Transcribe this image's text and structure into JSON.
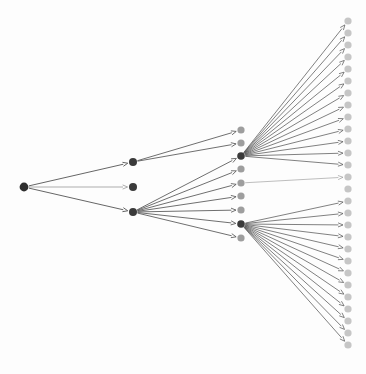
{
  "diagram": {
    "type": "directed-tree",
    "canvas": {
      "width": 366,
      "height": 374,
      "background": "#fdfdfd"
    },
    "colors": {
      "node_dark": "#3a3a3a",
      "node_mid": "#7a7a7a",
      "node_light": "#c8c8c8",
      "edge_dark": "#4a4a4a",
      "edge_light": "#9a9a9a",
      "background": "#fdfdfd"
    },
    "levels": [
      {
        "name": "level-0-root",
        "x": 24,
        "node_radius": 4.2,
        "nodes": [
          {
            "id": "r0",
            "y": 187,
            "color": "#2e2e2e",
            "radius": 4.4
          }
        ]
      },
      {
        "name": "level-1",
        "x": 133,
        "node_radius": 4.0,
        "nodes": [
          {
            "id": "a0",
            "y": 162,
            "color": "#3a3a3a",
            "radius": 4.0
          },
          {
            "id": "a1",
            "y": 187,
            "color": "#3a3a3a",
            "radius": 4.0
          },
          {
            "id": "a2",
            "y": 212,
            "color": "#3a3a3a",
            "radius": 4.0
          }
        ]
      },
      {
        "name": "level-2",
        "x": 241,
        "node_radius": 3.6,
        "nodes": [
          {
            "id": "b0",
            "y": 130,
            "color": "#9e9e9e",
            "radius": 3.6
          },
          {
            "id": "b1",
            "y": 143,
            "color": "#9e9e9e",
            "radius": 3.6
          },
          {
            "id": "b2",
            "y": 156,
            "color": "#3a3a3a",
            "radius": 3.8
          },
          {
            "id": "b3",
            "y": 169,
            "color": "#9e9e9e",
            "radius": 3.6
          },
          {
            "id": "b4",
            "y": 183,
            "color": "#9e9e9e",
            "radius": 3.6
          },
          {
            "id": "b5",
            "y": 196,
            "color": "#9e9e9e",
            "radius": 3.6
          },
          {
            "id": "b6",
            "y": 210,
            "color": "#9e9e9e",
            "radius": 3.6
          },
          {
            "id": "b7",
            "y": 224,
            "color": "#3a3a3a",
            "radius": 3.8
          },
          {
            "id": "b8",
            "y": 238,
            "color": "#9e9e9e",
            "radius": 3.6
          }
        ]
      },
      {
        "name": "level-3-leaves",
        "x": 348,
        "node_radius": 3.6,
        "nodes": [
          {
            "id": "c0",
            "y": 21,
            "color": "#c6c6c6",
            "radius": 3.6
          },
          {
            "id": "c1",
            "y": 33,
            "color": "#c6c6c6",
            "radius": 3.6
          },
          {
            "id": "c2",
            "y": 45,
            "color": "#c6c6c6",
            "radius": 3.6
          },
          {
            "id": "c3",
            "y": 57,
            "color": "#c6c6c6",
            "radius": 3.6
          },
          {
            "id": "c4",
            "y": 69,
            "color": "#c6c6c6",
            "radius": 3.6
          },
          {
            "id": "c5",
            "y": 81,
            "color": "#c6c6c6",
            "radius": 3.6
          },
          {
            "id": "c6",
            "y": 93,
            "color": "#c6c6c6",
            "radius": 3.6
          },
          {
            "id": "c7",
            "y": 105,
            "color": "#c6c6c6",
            "radius": 3.6
          },
          {
            "id": "c8",
            "y": 117,
            "color": "#c6c6c6",
            "radius": 3.6
          },
          {
            "id": "c9",
            "y": 129,
            "color": "#c6c6c6",
            "radius": 3.6
          },
          {
            "id": "c10",
            "y": 141,
            "color": "#c6c6c6",
            "radius": 3.6
          },
          {
            "id": "c11",
            "y": 153,
            "color": "#c6c6c6",
            "radius": 3.6
          },
          {
            "id": "c12",
            "y": 165,
            "color": "#c6c6c6",
            "radius": 3.6
          },
          {
            "id": "c13",
            "y": 177,
            "color": "#c6c6c6",
            "radius": 3.6
          },
          {
            "id": "c14",
            "y": 189,
            "color": "#c6c6c6",
            "radius": 3.6
          },
          {
            "id": "c15",
            "y": 201,
            "color": "#c6c6c6",
            "radius": 3.6
          },
          {
            "id": "c16",
            "y": 213,
            "color": "#c6c6c6",
            "radius": 3.6
          },
          {
            "id": "c17",
            "y": 225,
            "color": "#c6c6c6",
            "radius": 3.6
          },
          {
            "id": "c18",
            "y": 237,
            "color": "#c6c6c6",
            "radius": 3.6
          },
          {
            "id": "c19",
            "y": 249,
            "color": "#c6c6c6",
            "radius": 3.6
          },
          {
            "id": "c20",
            "y": 261,
            "color": "#c6c6c6",
            "radius": 3.6
          },
          {
            "id": "c21",
            "y": 273,
            "color": "#c6c6c6",
            "radius": 3.6
          },
          {
            "id": "c22",
            "y": 285,
            "color": "#c6c6c6",
            "radius": 3.6
          },
          {
            "id": "c23",
            "y": 297,
            "color": "#c6c6c6",
            "radius": 3.6
          },
          {
            "id": "c24",
            "y": 309,
            "color": "#c6c6c6",
            "radius": 3.6
          },
          {
            "id": "c25",
            "y": 321,
            "color": "#c6c6c6",
            "radius": 3.6
          },
          {
            "id": "c26",
            "y": 333,
            "color": "#c6c6c6",
            "radius": 3.6
          },
          {
            "id": "c27",
            "y": 345,
            "color": "#c6c6c6",
            "radius": 3.6
          }
        ]
      }
    ],
    "edges": [
      {
        "from": "r0",
        "to": "a0",
        "stroke": "#4a4a4a",
        "width": 0.85,
        "arrow": true
      },
      {
        "from": "r0",
        "to": "a1",
        "stroke": "#8a8a8a",
        "width": 0.7,
        "arrow": true
      },
      {
        "from": "r0",
        "to": "a2",
        "stroke": "#4a4a4a",
        "width": 0.85,
        "arrow": true
      },
      {
        "from": "a0",
        "to": "b0",
        "stroke": "#4a4a4a",
        "width": 0.8,
        "arrow": true
      },
      {
        "from": "a0",
        "to": "b1",
        "stroke": "#4a4a4a",
        "width": 0.8,
        "arrow": true
      },
      {
        "from": "a2",
        "to": "b2",
        "stroke": "#4a4a4a",
        "width": 0.8,
        "arrow": true
      },
      {
        "from": "a2",
        "to": "b3",
        "stroke": "#4a4a4a",
        "width": 0.8,
        "arrow": true
      },
      {
        "from": "a2",
        "to": "b4",
        "stroke": "#4a4a4a",
        "width": 0.8,
        "arrow": true
      },
      {
        "from": "a2",
        "to": "b5",
        "stroke": "#4a4a4a",
        "width": 0.8,
        "arrow": true
      },
      {
        "from": "a2",
        "to": "b6",
        "stroke": "#4a4a4a",
        "width": 0.8,
        "arrow": true
      },
      {
        "from": "a2",
        "to": "b7",
        "stroke": "#4a4a4a",
        "width": 0.8,
        "arrow": true
      },
      {
        "from": "a2",
        "to": "b8",
        "stroke": "#4a4a4a",
        "width": 0.8,
        "arrow": true
      },
      {
        "from": "b2",
        "to": "c0",
        "stroke": "#4a4a4a",
        "width": 0.7,
        "arrow": true
      },
      {
        "from": "b2",
        "to": "c1",
        "stroke": "#4a4a4a",
        "width": 0.7,
        "arrow": true
      },
      {
        "from": "b2",
        "to": "c2",
        "stroke": "#4a4a4a",
        "width": 0.7,
        "arrow": true
      },
      {
        "from": "b2",
        "to": "c3",
        "stroke": "#4a4a4a",
        "width": 0.7,
        "arrow": true
      },
      {
        "from": "b2",
        "to": "c4",
        "stroke": "#4a4a4a",
        "width": 0.7,
        "arrow": true
      },
      {
        "from": "b2",
        "to": "c5",
        "stroke": "#4a4a4a",
        "width": 0.7,
        "arrow": true
      },
      {
        "from": "b2",
        "to": "c6",
        "stroke": "#4a4a4a",
        "width": 0.7,
        "arrow": true
      },
      {
        "from": "b2",
        "to": "c7",
        "stroke": "#4a4a4a",
        "width": 0.7,
        "arrow": true
      },
      {
        "from": "b2",
        "to": "c8",
        "stroke": "#4a4a4a",
        "width": 0.7,
        "arrow": true
      },
      {
        "from": "b2",
        "to": "c9",
        "stroke": "#4a4a4a",
        "width": 0.7,
        "arrow": true
      },
      {
        "from": "b2",
        "to": "c10",
        "stroke": "#4a4a4a",
        "width": 0.7,
        "arrow": true
      },
      {
        "from": "b2",
        "to": "c11",
        "stroke": "#4a4a4a",
        "width": 0.7,
        "arrow": true
      },
      {
        "from": "b2",
        "to": "c12",
        "stroke": "#4a4a4a",
        "width": 0.7,
        "arrow": true
      },
      {
        "from": "b4",
        "to": "c13",
        "stroke": "#9a9a9a",
        "width": 0.65,
        "arrow": true
      },
      {
        "from": "b7",
        "to": "c15",
        "stroke": "#4a4a4a",
        "width": 0.7,
        "arrow": true
      },
      {
        "from": "b7",
        "to": "c16",
        "stroke": "#4a4a4a",
        "width": 0.7,
        "arrow": true
      },
      {
        "from": "b7",
        "to": "c17",
        "stroke": "#4a4a4a",
        "width": 0.7,
        "arrow": true
      },
      {
        "from": "b7",
        "to": "c18",
        "stroke": "#4a4a4a",
        "width": 0.7,
        "arrow": true
      },
      {
        "from": "b7",
        "to": "c19",
        "stroke": "#4a4a4a",
        "width": 0.7,
        "arrow": true
      },
      {
        "from": "b7",
        "to": "c20",
        "stroke": "#4a4a4a",
        "width": 0.7,
        "arrow": true
      },
      {
        "from": "b7",
        "to": "c21",
        "stroke": "#4a4a4a",
        "width": 0.7,
        "arrow": true
      },
      {
        "from": "b7",
        "to": "c22",
        "stroke": "#4a4a4a",
        "width": 0.7,
        "arrow": true
      },
      {
        "from": "b7",
        "to": "c23",
        "stroke": "#4a4a4a",
        "width": 0.7,
        "arrow": true
      },
      {
        "from": "b7",
        "to": "c24",
        "stroke": "#4a4a4a",
        "width": 0.7,
        "arrow": true
      },
      {
        "from": "b7",
        "to": "c25",
        "stroke": "#4a4a4a",
        "width": 0.7,
        "arrow": true
      },
      {
        "from": "b7",
        "to": "c26",
        "stroke": "#4a4a4a",
        "width": 0.7,
        "arrow": true
      },
      {
        "from": "b7",
        "to": "c27",
        "stroke": "#4a4a4a",
        "width": 0.7,
        "arrow": true
      }
    ],
    "counts": {
      "level_0_nodes": 1,
      "level_1_nodes": 3,
      "level_2_nodes": 9,
      "level_3_nodes": 28,
      "total_edges": 39
    }
  }
}
